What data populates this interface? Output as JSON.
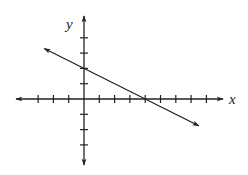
{
  "chart_data": {
    "type": "line",
    "title": "",
    "xlabel": "x",
    "ylabel": "y",
    "grid": false,
    "legend": null,
    "xlim": [
      -4.5,
      9
    ],
    "ylim": [
      -4.3,
      5.3
    ],
    "x_ticks": [
      -3,
      -2,
      -1,
      1,
      2,
      3,
      4,
      5,
      6,
      7,
      8
    ],
    "y_ticks": [
      -3,
      -2,
      -1,
      1,
      2,
      3,
      4
    ],
    "tick_labels_shown": false,
    "series": [
      {
        "name": "line",
        "equation": "y = -x/2 + 2",
        "slope": -0.5,
        "y_intercept": 2,
        "x_intercept": 4,
        "x": [
          -2.6,
          0,
          4,
          7.5
        ],
        "y": [
          3.3,
          2,
          0,
          -1.75
        ],
        "arrows_both_ends": true
      }
    ]
  },
  "style": {
    "axis_color": "#222222",
    "line_color": "#222222"
  }
}
